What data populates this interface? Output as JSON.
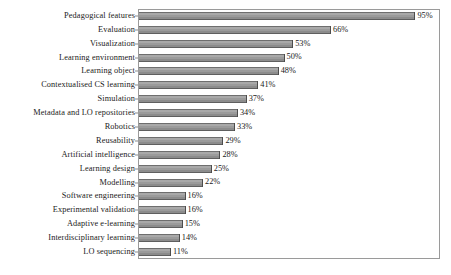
{
  "chart_data": {
    "type": "bar",
    "orientation": "horizontal",
    "title": "",
    "xlabel": "",
    "ylabel": "",
    "xlim": [
      0,
      100
    ],
    "grid": false,
    "legend": null,
    "value_suffix": "%",
    "bar_color": "#9b9b9b",
    "border_color": "#9a9a9a",
    "categories": [
      "Pedagogical features",
      "Evaluation",
      "Visualization",
      "Learning environment",
      "Learning object",
      "Contextualised CS learning",
      "Simulation",
      "Metadata and LO repositories",
      "Robotics",
      "Reusability",
      "Artificial intelligence",
      "Learning design",
      "Modelling",
      "Software engineering",
      "Experimental validation",
      "Adaptive e-learning",
      "Interdisciplinary learning",
      "LO sequencing"
    ],
    "values": [
      95,
      66,
      53,
      50,
      48,
      41,
      37,
      34,
      33,
      29,
      28,
      25,
      22,
      16,
      16,
      15,
      14,
      11
    ],
    "labels": [
      "95%",
      "66%",
      "53%",
      "50%",
      "48%",
      "41%",
      "37%",
      "34%",
      "33%",
      "29%",
      "28%",
      "25%",
      "22%",
      "16%",
      "16%",
      "15%",
      "14%",
      "11%"
    ]
  }
}
